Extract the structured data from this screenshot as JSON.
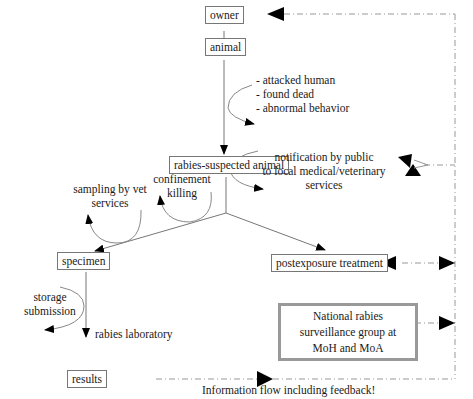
{
  "diagram": {
    "type": "flowchart",
    "nodes": {
      "owner": "owner",
      "animal": "animal",
      "rabies_suspected": "rabies-suspected animal",
      "specimen": "specimen",
      "postexposure": "postexposure treatment",
      "results": "results",
      "national_group": {
        "line1": "National rabies",
        "line2": "surveillance group at",
        "line3": "MoH and MoA"
      }
    },
    "edge_labels": {
      "animal_triggers": [
        "- attacked human",
        "- found dead",
        "- abnormal behavior"
      ],
      "notification": [
        "notification by public",
        "to local medical/veterinary",
        "services"
      ],
      "confinement": [
        "confinement",
        "killing"
      ],
      "sampling": [
        "sampling by vet",
        "services"
      ],
      "storage": [
        "storage",
        "submission"
      ],
      "lab": "rabies laboratory"
    },
    "caption": "Information flow including feedback!",
    "colors": {
      "line": "#777777",
      "dashed": "#999999",
      "arrowhead": "#000000",
      "group_border": "#999999"
    }
  }
}
